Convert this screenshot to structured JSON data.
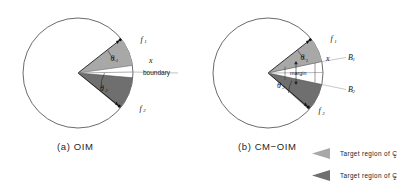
{
  "figure": {
    "title_alt": "Comparison of OIM and CM-OIM target regions",
    "panels": [
      {
        "id": "oim",
        "caption": "(a) OIM",
        "labels": {
          "f1": "f",
          "f1_sub": "1",
          "f2": "f",
          "f2_sub": "2",
          "x": "x",
          "boundary": "boundary",
          "theta1": "θ",
          "theta1_sub": "1",
          "theta2": "θ",
          "theta2_sub": "2"
        }
      },
      {
        "id": "cm-oim",
        "caption": "(b) CM−OIM",
        "labels": {
          "f1": "f",
          "f1_sub": "1",
          "f2": "f",
          "f2_sub": "2",
          "x": "x",
          "b1": "B",
          "b1_sub": "1",
          "b2": "B",
          "b2_sub": "2",
          "margin": "margin",
          "theta1": "θ",
          "theta1_sub": "1",
          "theta2": "θ",
          "theta2_sub": "2"
        }
      }
    ],
    "legend": {
      "items": [
        {
          "label": "Target region of C",
          "sub": "1",
          "color": "#a8a8a8",
          "name": "target-region-c1"
        },
        {
          "label": "Target region of C",
          "sub": "2",
          "color": "#6f6f6f",
          "name": "target-region-c2"
        }
      ]
    },
    "colors": {
      "region_c1": "#a8a8a8",
      "region_c2": "#6f6f6f",
      "circle_stroke": "#555555",
      "line": "#111111",
      "background": "#ffffff"
    },
    "geometry": {
      "panel_a": {
        "circle_center_x": 78,
        "circle_center_y": 73,
        "circle_radius": 55,
        "apex_x": 78,
        "apex_y": 73,
        "c1_start_deg": -38,
        "c1_end_deg": -8,
        "c2_start_deg": 5,
        "c2_end_deg": 40
      },
      "panel_b": {
        "circle_center_x": 268,
        "circle_center_y": 73,
        "circle_radius": 55,
        "apex_x": 268,
        "apex_y": 73,
        "c1_start_deg": -38,
        "c1_end_deg": -12,
        "c2_start_deg": 12,
        "c2_end_deg": 42
      }
    }
  }
}
